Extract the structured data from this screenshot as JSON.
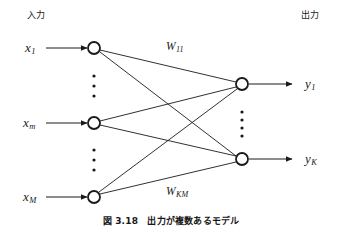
{
  "figure": {
    "caption": "図 3.18　出力が複数あるモデル",
    "header_input": "入力",
    "header_output": "出力",
    "background_color": "#ffffff",
    "stroke_color": "#1a1a1a"
  },
  "input_layer": {
    "label_x1_base": "x",
    "label_x1_sub": "1",
    "label_xm_base": "x",
    "label_xm_sub": "m",
    "label_xM_base": "x",
    "label_xM_sub": "M",
    "nodes": [
      {
        "name": "input-node-1",
        "cx": 94,
        "cy": 48,
        "r": 6
      },
      {
        "name": "input-node-m",
        "cx": 94,
        "cy": 123,
        "r": 6
      },
      {
        "name": "input-node-M",
        "cx": 94,
        "cy": 197,
        "r": 6
      }
    ],
    "ellipsis_upper": {
      "cx": 94,
      "cy_start": 76,
      "count": 3
    },
    "ellipsis_lower": {
      "cx": 94,
      "cy_start": 150,
      "count": 3
    }
  },
  "output_layer": {
    "label_y1_base": "y",
    "label_y1_sub": "1",
    "label_yK_base": "y",
    "label_yK_sub": "K",
    "nodes": [
      {
        "name": "output-node-1",
        "cx": 242,
        "cy": 84,
        "r": 6
      },
      {
        "name": "output-node-K",
        "cx": 242,
        "cy": 159,
        "r": 6
      }
    ],
    "ellipsis": {
      "cx": 242,
      "cy_start": 112,
      "count": 4
    }
  },
  "weights": {
    "w11_base": "W",
    "w11_sub": "11",
    "wkm_base": "W",
    "wkm_sub": "KM"
  },
  "connections": [
    {
      "from": "input-node-1",
      "to": "output-node-1"
    },
    {
      "from": "input-node-1",
      "to": "output-node-K"
    },
    {
      "from": "input-node-m",
      "to": "output-node-1"
    },
    {
      "from": "input-node-m",
      "to": "output-node-K"
    },
    {
      "from": "input-node-M",
      "to": "output-node-1"
    },
    {
      "from": "input-node-M",
      "to": "output-node-K"
    }
  ]
}
